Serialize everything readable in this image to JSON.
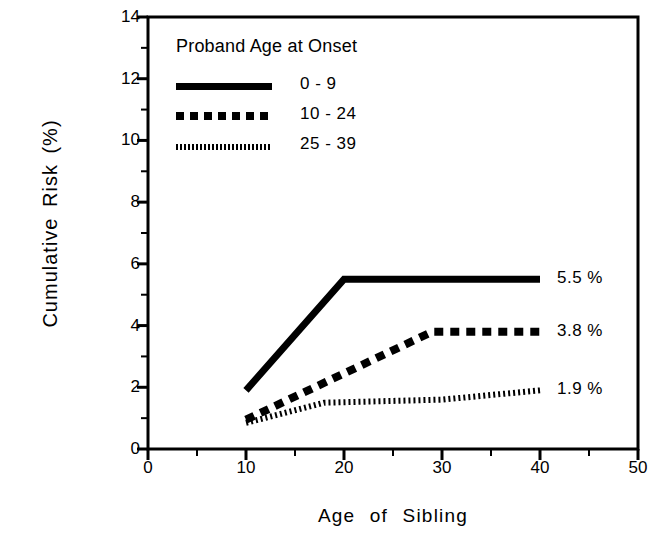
{
  "chart_data": {
    "type": "line",
    "title": "",
    "xlabel": "Age  of  Sibling",
    "ylabel": "Cumulative Risk (%)",
    "xlim": [
      0,
      50
    ],
    "ylim": [
      0,
      14
    ],
    "xticks": [
      0,
      10,
      20,
      30,
      40,
      50
    ],
    "xtick_labels": [
      "0",
      "10",
      "20",
      "30",
      "40",
      "50"
    ],
    "xminor_ticks": [
      5,
      15,
      25,
      35,
      45
    ],
    "yticks": [
      0,
      2,
      4,
      6,
      8,
      10,
      12,
      14
    ],
    "ytick_labels": [
      "0",
      "2",
      "4",
      "6",
      "8",
      "10",
      "12",
      "14"
    ],
    "yminor_ticks": [
      1,
      3,
      5,
      7,
      9,
      11,
      13
    ],
    "grid": false,
    "legend_position": "upper left",
    "legend_title": "Proband Age at Onset",
    "series": [
      {
        "name": "0 - 9",
        "style": "solid",
        "x": [
          10,
          20,
          40
        ],
        "values": [
          1.9,
          5.5,
          5.5
        ],
        "end_label": "5.5 %"
      },
      {
        "name": "10 - 24",
        "style": "dashed",
        "x": [
          10,
          29,
          40
        ],
        "values": [
          0.95,
          3.8,
          3.8
        ],
        "end_label": "3.8 %"
      },
      {
        "name": "25 - 39",
        "style": "dotted",
        "x": [
          10,
          18,
          30,
          40
        ],
        "values": [
          0.85,
          1.5,
          1.6,
          1.9
        ],
        "end_label": "1.9 %"
      }
    ]
  },
  "colors": {
    "foreground": "#000000",
    "background": "#ffffff"
  }
}
